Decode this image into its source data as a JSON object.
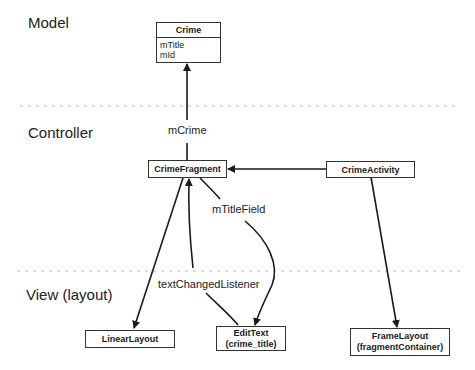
{
  "layers": {
    "model": "Model",
    "controller": "Controller",
    "view": "View (layout)"
  },
  "nodes": {
    "crime": {
      "title": "Crime",
      "fields": [
        "mTitle",
        "mId"
      ]
    },
    "crime_fragment": {
      "title": "CrimeFragment"
    },
    "crime_activity": {
      "title": "CrimeActivity"
    },
    "linear_layout": {
      "title": "LinearLayout"
    },
    "edit_text": {
      "title": "EditText",
      "subtitle": "(crime_title)"
    },
    "frame_layout": {
      "title": "FrameLayout",
      "subtitle": "(fragmentContainer)"
    }
  },
  "edges": {
    "m_crime": "mCrime",
    "m_title_field": "mTitleField",
    "text_changed_listener": "textChangedListener"
  },
  "colors": {
    "line": "#1a1a1a",
    "divider": "#bbbbbb"
  }
}
